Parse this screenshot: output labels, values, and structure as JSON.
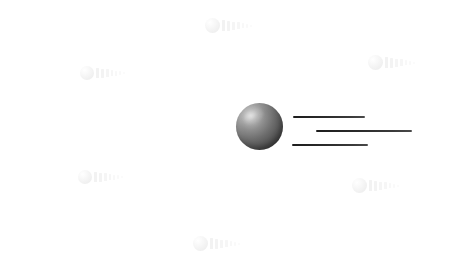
{
  "canvas": {
    "width": 459,
    "height": 273,
    "background_color": "#ffffff"
  },
  "illustration": {
    "name": "ball-with-motion-lines",
    "description": "Dark shaded sphere with three horizontal speed lines trailing to the right",
    "ball": {
      "label": "ball",
      "center_x": 259,
      "center_y": 126,
      "diameter": 47,
      "highlight_color": "#d2d2d2",
      "midtone_color": "#6d6d6d",
      "shadow_color": "#333333",
      "highlight_position": "upper-left"
    },
    "speed_lines": [
      {
        "label": "speed-line-top",
        "x": 293,
        "y": 116,
        "length": 72,
        "thickness": 2,
        "color": "#242424"
      },
      {
        "label": "speed-line-middle",
        "x": 316,
        "y": 130,
        "length": 96,
        "thickness": 2,
        "color": "#242424"
      },
      {
        "label": "speed-line-bottom",
        "x": 292,
        "y": 144,
        "length": 76,
        "thickness": 2,
        "color": "#242424"
      }
    ]
  },
  "watermarks": {
    "color": "#f2f2f2",
    "motif": "ball-with-motion-lines",
    "bar_count": 7,
    "items": [
      {
        "label": "watermark-top-center",
        "x": 205,
        "y": 18,
        "scale": 1.0
      },
      {
        "label": "watermark-left-upper",
        "x": 80,
        "y": 66,
        "scale": 0.95
      },
      {
        "label": "watermark-right-upper",
        "x": 368,
        "y": 55,
        "scale": 1.0
      },
      {
        "label": "watermark-left-lower",
        "x": 78,
        "y": 170,
        "scale": 0.95
      },
      {
        "label": "watermark-right-lower",
        "x": 352,
        "y": 178,
        "scale": 1.0
      },
      {
        "label": "watermark-bottom-center",
        "x": 193,
        "y": 236,
        "scale": 1.0
      }
    ]
  }
}
